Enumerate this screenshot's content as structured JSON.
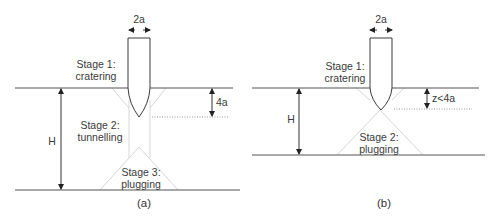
{
  "figure": {
    "panels": [
      {
        "caption": "(a)",
        "width_label": "2a",
        "height_label": "H",
        "depth_label": "4a",
        "stages": [
          {
            "line1": "Stage 1:",
            "line2": "cratering"
          },
          {
            "line1": "Stage 2:",
            "line2": "tunnelling"
          },
          {
            "line1": "Stage 3:",
            "line2": "plugging"
          }
        ]
      },
      {
        "caption": "(b)",
        "width_label": "2a",
        "height_label": "H",
        "depth_label": "z<4a",
        "stages": [
          {
            "line1": "Stage 1:",
            "line2": "cratering"
          },
          {
            "line1": "Stage 2:",
            "line2": "plugging"
          }
        ]
      }
    ]
  }
}
